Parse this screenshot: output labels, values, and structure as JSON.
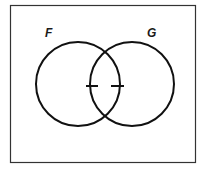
{
  "diagram": {
    "type": "venn",
    "universe": {
      "x": 10.5,
      "y": 5.5,
      "width": 185,
      "height": 157,
      "stroke": "#333333"
    },
    "sets": [
      {
        "label": "F",
        "cx": 78,
        "cy": 84,
        "r": 42,
        "label_x": 45,
        "label_y": 37
      },
      {
        "label": "G",
        "cx": 132,
        "cy": 84,
        "r": 42,
        "label_x": 147,
        "label_y": 37
      }
    ],
    "tick_marks": [
      {
        "x1": 86,
        "y1": 86,
        "x2": 98,
        "y2": 86
      },
      {
        "x1": 111,
        "y1": 86,
        "x2": 124,
        "y2": 86
      }
    ],
    "stroke_color": "#111111"
  }
}
